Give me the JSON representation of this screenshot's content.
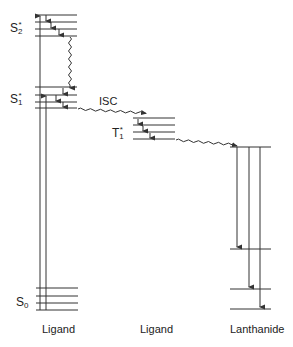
{
  "diagram": {
    "type": "jablonski-energy-level",
    "states": {
      "s2": {
        "base": "S",
        "sub": "2",
        "sup": "*"
      },
      "s1": {
        "base": "S",
        "sub": "1",
        "sup": "*"
      },
      "t1": {
        "base": "T",
        "sub": "1",
        "sup": "*"
      },
      "s0": {
        "base": "S",
        "sub": "0",
        "sup": ""
      }
    },
    "transition_labels": {
      "isc": "ISC"
    },
    "column_labels": {
      "ligand_singlet": "Ligand",
      "ligand_triplet": "Ligand",
      "lanthanide": "Lanthanide"
    },
    "colors": {
      "line": "#333333",
      "text": "#222222"
    }
  }
}
